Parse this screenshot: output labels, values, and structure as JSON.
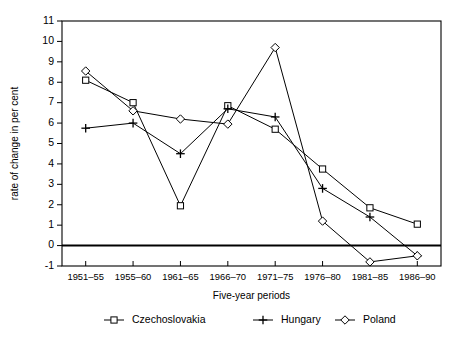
{
  "chart_data": {
    "type": "line",
    "title": "",
    "xlabel": "Five-year periods",
    "ylabel": "rate of change in per cent",
    "categories": [
      "1951–55",
      "1955–60",
      "1961–65",
      "1966–70",
      "1971–75",
      "1976–80",
      "1981–85",
      "1986–90"
    ],
    "ylim": [
      -1,
      11
    ],
    "yticks": [
      -1,
      0,
      1,
      2,
      3,
      4,
      5,
      6,
      7,
      8,
      9,
      10,
      11
    ],
    "ytick_labels": [
      "-1",
      "0",
      "1",
      "2",
      "3",
      "4",
      "5",
      "6",
      "7",
      "8",
      "9",
      "10",
      "11"
    ],
    "grid": false,
    "legend_position": "bottom",
    "zero_line": 0,
    "series": [
      {
        "name": "Czechoslovakia",
        "marker": "open-square",
        "values": [
          8.1,
          7.0,
          1.95,
          6.85,
          5.7,
          3.75,
          1.85,
          1.05
        ]
      },
      {
        "name": "Hungary",
        "marker": "plus",
        "values": [
          5.75,
          6.0,
          4.5,
          6.7,
          6.3,
          2.8,
          1.4,
          -0.5
        ]
      },
      {
        "name": "Poland",
        "marker": "open-diamond",
        "values": [
          8.55,
          6.6,
          6.2,
          5.95,
          9.7,
          1.2,
          -0.8,
          -0.5
        ]
      }
    ]
  },
  "legend": {
    "items": [
      {
        "label": "Czechoslovakia",
        "marker": "open-square"
      },
      {
        "label": "Hungary",
        "marker": "plus"
      },
      {
        "label": "Poland",
        "marker": "open-diamond"
      }
    ]
  },
  "colors": {
    "line": "#000000",
    "background": "#ffffff",
    "marker_fill": "#ffffff"
  }
}
